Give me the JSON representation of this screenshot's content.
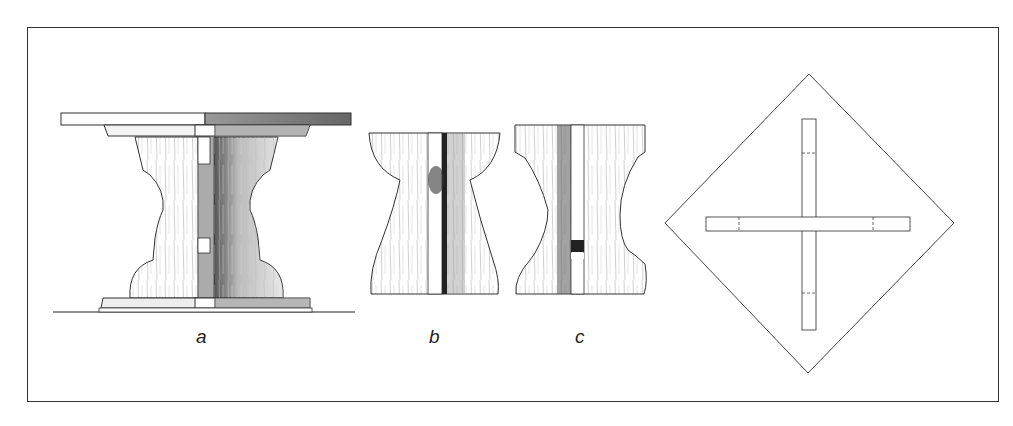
{
  "figure": {
    "views": [
      {
        "id": "a",
        "label": "a",
        "description": "Side elevation of pedestal table"
      },
      {
        "id": "b",
        "label": "b",
        "description": "Leg profile, end view"
      },
      {
        "id": "c",
        "label": "c",
        "description": "Leg profile, side view"
      },
      {
        "id": "plan",
        "label": "",
        "description": "Plan view: square top (rotated) with cross-base"
      }
    ]
  }
}
